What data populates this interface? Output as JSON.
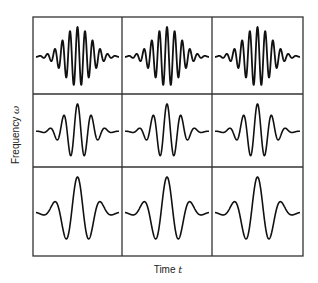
{
  "chart_data": {
    "type": "diagram",
    "title": "",
    "xlabel": "Time",
    "xlabel_symbol": "t",
    "ylabel": "Frequency",
    "ylabel_symbol": "ω",
    "grid": {
      "rows": 3,
      "cols": 3,
      "left": 33,
      "top": 17,
      "right": 303,
      "bottom": 256,
      "col_edges": [
        33,
        122,
        212,
        303
      ],
      "row_edges": [
        17,
        94,
        167,
        256
      ]
    },
    "cells": [
      {
        "row": 0,
        "col": 0,
        "frequency": "high",
        "cycles": 11,
        "amplitude": 1.0
      },
      {
        "row": 0,
        "col": 1,
        "frequency": "high",
        "cycles": 11,
        "amplitude": 1.0
      },
      {
        "row": 0,
        "col": 2,
        "frequency": "high",
        "cycles": 11,
        "amplitude": 1.0
      },
      {
        "row": 1,
        "col": 0,
        "frequency": "medium",
        "cycles": 6,
        "amplitude": 1.0
      },
      {
        "row": 1,
        "col": 1,
        "frequency": "medium",
        "cycles": 6,
        "amplitude": 1.0
      },
      {
        "row": 1,
        "col": 2,
        "frequency": "medium",
        "cycles": 6,
        "amplitude": 1.0
      },
      {
        "row": 2,
        "col": 0,
        "frequency": "low",
        "cycles": 3.5,
        "amplitude": 1.0
      },
      {
        "row": 2,
        "col": 1,
        "frequency": "low",
        "cycles": 3.5,
        "amplitude": 1.0
      },
      {
        "row": 2,
        "col": 2,
        "frequency": "low",
        "cycles": 3.5,
        "amplitude": 1.0
      }
    ],
    "line_color": "#111111",
    "grid_color": "#333333"
  }
}
